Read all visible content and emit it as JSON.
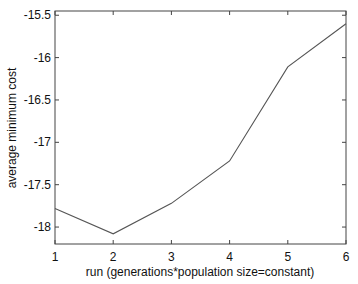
{
  "chart_data": {
    "type": "line",
    "title": "",
    "xlabel": "run (generations*population size=constant)",
    "ylabel": "average minimum cost",
    "x": [
      1,
      2,
      3,
      4,
      5,
      6
    ],
    "series": [
      {
        "name": "average minimum cost",
        "values": [
          -17.78,
          -18.08,
          -17.72,
          -17.22,
          -16.11,
          -15.6
        ]
      }
    ],
    "xlim": [
      1,
      6
    ],
    "ylim": [
      -18.2,
      -15.45
    ],
    "xticks": [
      "1",
      "2",
      "3",
      "4",
      "5",
      "6"
    ],
    "yticks": [
      "-15.5",
      "-16",
      "-16.5",
      "-17",
      "-17.5",
      "-18"
    ],
    "ytick_values": [
      -15.5,
      -16,
      -16.5,
      -17,
      -17.5,
      -18
    ],
    "grid": false,
    "legend": null,
    "line_color": "#555555"
  }
}
